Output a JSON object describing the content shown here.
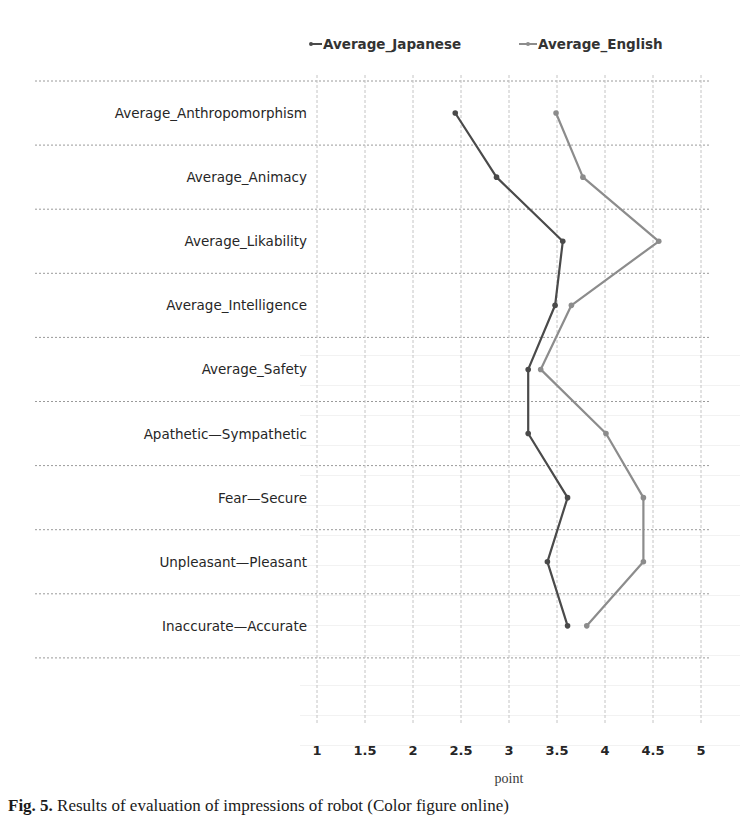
{
  "chart_data": {
    "type": "line",
    "orientation": "horizontal-value-axis",
    "title": "",
    "xlabel": "point",
    "ylabel": "",
    "xlim": [
      1,
      5
    ],
    "x_ticks": [
      "1",
      "1.5",
      "2",
      "2.5",
      "3",
      "3.5",
      "4",
      "4.5",
      "5"
    ],
    "grid": true,
    "legend_position": "top",
    "categories": [
      "Average_Anthropomorphism",
      "Average_Animacy",
      "Average_Likability",
      "Average_Intelligence",
      "Average_Safety",
      "Apathetic—Sympathetic",
      "Fear—Secure",
      "Unpleasant—Pleasant",
      "Inaccurate—Accurate"
    ],
    "series": [
      {
        "name": "Average_Japanese",
        "color": "#4a4a4a",
        "values": [
          2.44,
          2.87,
          3.56,
          3.48,
          3.2,
          3.2,
          3.61,
          3.4,
          3.61
        ]
      },
      {
        "name": "Average_English",
        "color": "#8c8c8c",
        "values": [
          3.49,
          3.77,
          4.56,
          3.65,
          3.33,
          4.01,
          4.4,
          4.4,
          3.81
        ]
      }
    ]
  },
  "legend": {
    "japanese_label": "Average_Japanese",
    "english_label": "Average_English"
  },
  "axis": {
    "title": "point"
  },
  "caption": {
    "prefix": "Fig. 5.",
    "text": " Results of evaluation of impressions of robot (Color figure online)"
  }
}
